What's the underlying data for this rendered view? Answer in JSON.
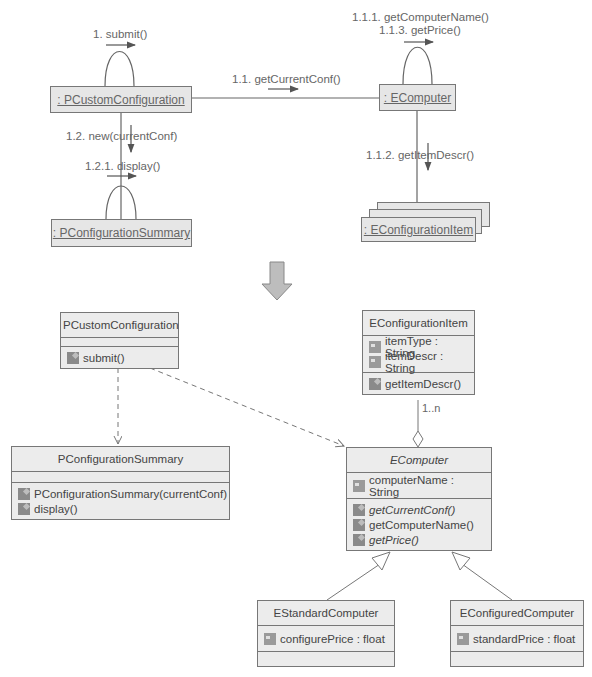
{
  "collaboration_diagram": {
    "objects": {
      "pcustom": ": PCustomConfiguration",
      "ecomputer": ": EComputer",
      "psummary": ": PConfigurationSummary",
      "eitem": ": EConfigurationItem"
    },
    "messages": {
      "m1": "1. submit()",
      "m11": "1.1. getCurrentConf()",
      "m111": "1.1.1. getComputerName()",
      "m113": "1.1.3. getPrice()",
      "m112": "1.1.2. getItemDescr()",
      "m12": "1.2. new(currentConf)",
      "m121": "1.2.1. display()"
    }
  },
  "class_diagram": {
    "pcustom": {
      "name": "PCustomConfiguration",
      "operations": [
        "submit()"
      ]
    },
    "eitem": {
      "name": "EConfigurationItem",
      "attributes": [
        "itemType : String",
        "itemDescr : String"
      ],
      "operations": [
        "getItemDescr()"
      ]
    },
    "psummary": {
      "name": "PConfigurationSummary",
      "operations": [
        "PConfigurationSummary(currentConf)",
        "display()"
      ]
    },
    "ecomputer": {
      "name": "EComputer",
      "attributes": [
        "computerName : String"
      ],
      "operations": [
        "getCurrentConf()",
        "getComputerName()",
        "getPrice()"
      ]
    },
    "estandard": {
      "name": "EStandardComputer",
      "attributes": [
        "configurePrice : float"
      ]
    },
    "econfigured": {
      "name": "EConfiguredComputer",
      "attributes": [
        "standardPrice : float"
      ]
    },
    "multiplicity": "1..n"
  }
}
